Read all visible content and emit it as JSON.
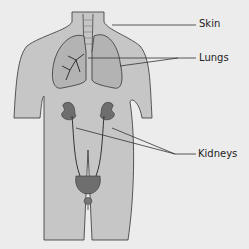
{
  "diagram": {
    "labels": [
      {
        "id": "skin",
        "text": "Skin"
      },
      {
        "id": "lungs",
        "text": "Lungs"
      },
      {
        "id": "kidneys",
        "text": "Kidneys"
      }
    ]
  },
  "colors": {
    "background": "#ececec",
    "body_fill": "#c6c6c6",
    "outline": "#333333",
    "lung_fill": "#b3b3b3",
    "organ_fill": "#6e6e6e"
  }
}
